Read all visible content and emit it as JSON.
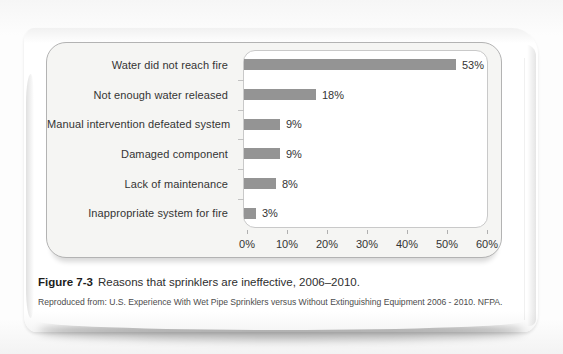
{
  "page": {
    "caption": {
      "label": "Figure 7-3",
      "text": "Reasons that sprinklers are ineffective, 2006–2010."
    },
    "source": "Reproduced from: U.S. Experience With Wet Pipe Sprinklers versus Without Extinguishing Equipment 2006 - 2010. NFPA."
  },
  "chart_data": {
    "type": "bar",
    "orientation": "horizontal",
    "categories": [
      "Water did not reach fire",
      "Not enough water released",
      "Manual intervention defeated system",
      "Damaged component",
      "Lack of maintenance",
      "Inappropriate system for fire"
    ],
    "values": [
      53,
      18,
      9,
      9,
      8,
      3
    ],
    "value_labels": [
      "53%",
      "18%",
      "9%",
      "9%",
      "8%",
      "3%"
    ],
    "x_axis": {
      "min": 0,
      "max": 60,
      "unit": "%",
      "ticks": [
        "0%",
        "10%",
        "20%",
        "30%",
        "40%",
        "50%",
        "60%"
      ]
    },
    "grid": false,
    "legend": false,
    "bar_color": "#949494"
  }
}
